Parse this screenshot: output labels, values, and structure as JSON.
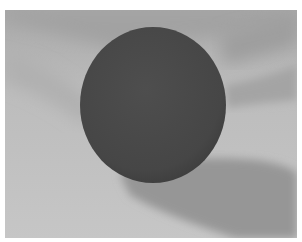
{
  "scene": {
    "description": "Grayscale render of a dark sphere resting above a light surface with soft cast shadows",
    "colors": {
      "background": "#ffffff",
      "surface_light": "#c4c4c4",
      "surface_mid": "#b0b0b0",
      "shadow_band": "#9c9c9c",
      "sphere_dark": "#4a4a4a",
      "sphere_edge": "#3e3e3e",
      "cast_shadow": "#8e8e8e"
    },
    "sphere": {
      "cx": 148,
      "cy": 95,
      "rx": 73,
      "ry": 78
    }
  }
}
